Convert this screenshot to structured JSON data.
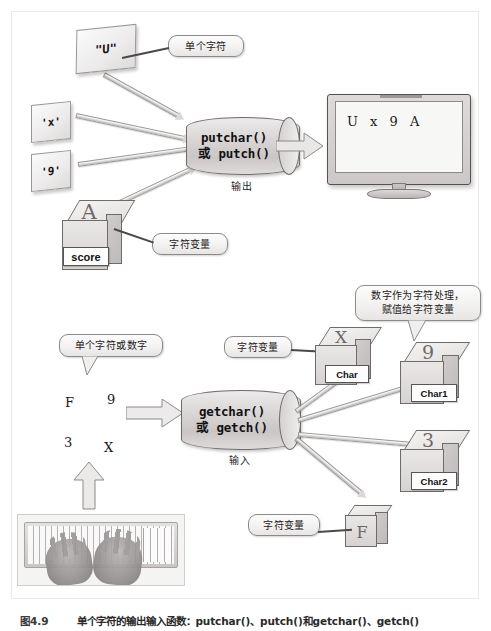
{
  "figure": {
    "number": "图4.9",
    "caption": "单个字符的输出输入函数：putchar()、putch()和getchar()、getch()"
  },
  "output_section": {
    "cards": [
      {
        "name": "literal-string-u",
        "text": "\"U\""
      },
      {
        "name": "literal-char-x",
        "text": "'x'"
      },
      {
        "name": "literal-char-9",
        "text": "'9'"
      }
    ],
    "callouts": [
      {
        "name": "single-character",
        "text": "单个字符"
      },
      {
        "name": "char-variable",
        "text": "字符变量"
      }
    ],
    "variable_box": {
      "glyph": "A",
      "label": "score"
    },
    "process": {
      "line1": "putchar()",
      "line2": "或 putch()",
      "label": "输出"
    },
    "monitor": {
      "display": "U  x  9  A"
    }
  },
  "input_section": {
    "callouts": [
      {
        "name": "single-char-or-digit",
        "text": "单个字符或数字"
      },
      {
        "name": "char-variable-top",
        "text": "字符变量"
      },
      {
        "name": "digit-as-char",
        "line1": "数字作为字符处理，",
        "line2": "赋值给字符变量"
      },
      {
        "name": "char-variable-bottom",
        "text": "字符变量"
      }
    ],
    "typed_chars": [
      "F",
      "9",
      "3",
      "X"
    ],
    "process": {
      "line1": "getchar()",
      "line2": "或 getch()",
      "label": "输入"
    },
    "variable_boxes": [
      {
        "glyph": "X",
        "label": "Char"
      },
      {
        "glyph": "9",
        "label": "Char1"
      },
      {
        "glyph": "3",
        "label": "Char2"
      },
      {
        "glyph": "F",
        "label": ""
      }
    ]
  },
  "colors": {
    "ink": "#1b1b1b",
    "outline": "#6e6c6b",
    "fill_light": "#ececea",
    "fill_mid": "#d6d3d2"
  }
}
